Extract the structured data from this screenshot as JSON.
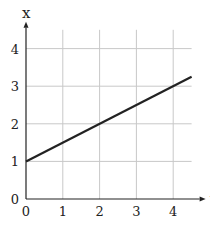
{
  "chart_data": {
    "type": "line",
    "title": "",
    "xlabel": "t",
    "ylabel": "x",
    "xlim": [
      0,
      4.5
    ],
    "ylim": [
      0,
      4.5
    ],
    "x_ticks": [
      0,
      1,
      2,
      3,
      4
    ],
    "y_ticks": [
      0,
      1,
      2,
      3,
      4
    ],
    "grid": true,
    "legend": null,
    "series": [
      {
        "name": "x(t)",
        "x": [
          0,
          4.5
        ],
        "values": [
          1,
          3.25
        ],
        "color": "#222222"
      }
    ]
  },
  "labels": {
    "x_axis": "t",
    "y_axis": "x",
    "x_ticks": [
      "0",
      "1",
      "2",
      "3",
      "4"
    ],
    "y_ticks": [
      "0",
      "1",
      "2",
      "3",
      "4"
    ]
  },
  "colors": {
    "grid": "#c8c8c8",
    "axis": "#222222",
    "line": "#222222"
  }
}
